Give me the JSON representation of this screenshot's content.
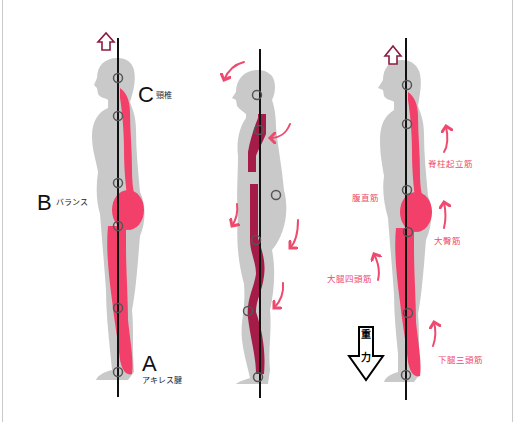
{
  "colors": {
    "body_gray": "#c8c8c8",
    "muscle_pink": "#f2406a",
    "muscle_dark": "#a61c48",
    "arrow_pink": "#ef4a6e",
    "up_arrow": "#8a1c3c",
    "plumb_line": "#111111",
    "joint_circle": "#555555",
    "frame_border": "#c9c9c9"
  },
  "figures": [
    {
      "id": "good-posture",
      "labels": [
        {
          "letter": "C",
          "text": "頸椎"
        },
        {
          "letter": "B",
          "text": "バランス"
        },
        {
          "letter": "A",
          "text": "アキレス腱"
        }
      ],
      "icons": [
        "up-arrow-icon",
        "plumb-line",
        "joint-circle-icon"
      ]
    },
    {
      "id": "bad-posture",
      "labels": [],
      "icons": [
        "curved-arrow-icon",
        "plumb-line",
        "joint-circle-icon"
      ]
    },
    {
      "id": "antigravity-muscles",
      "labels": [
        {
          "text": "脊柱起立筋"
        },
        {
          "text": "腹直筋"
        },
        {
          "text": "大臀筋"
        },
        {
          "text": "大腿四頭筋"
        },
        {
          "text": "下腿三頭筋"
        }
      ],
      "gravity": {
        "line1": "重",
        "line2": "力"
      }
    }
  ]
}
